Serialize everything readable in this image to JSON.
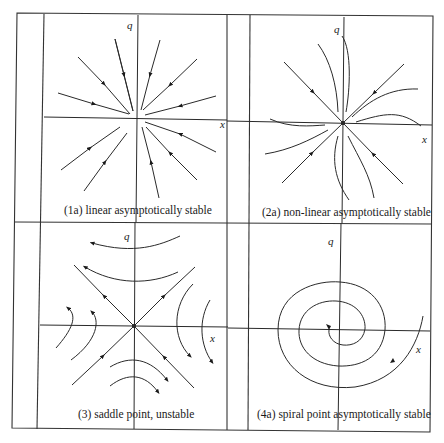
{
  "figure": {
    "panels": [
      {
        "id": "1a",
        "caption": "(1a) linear asymptotically stable",
        "type": "stable node (linear)",
        "x_label": "x",
        "q_label": "q"
      },
      {
        "id": "2a",
        "caption": "(2a) non-linear asymptotically stable",
        "type": "stable node (non-linear)",
        "x_label": "x",
        "q_label": "q"
      },
      {
        "id": "3",
        "caption": "(3) saddle point, unstable",
        "type": "saddle point",
        "x_label": "x",
        "q_label": "q"
      },
      {
        "id": "4a",
        "caption": "(4a) spiral point asymptotically stable",
        "type": "stable spiral",
        "x_label": "x",
        "q_label": "q"
      }
    ]
  }
}
